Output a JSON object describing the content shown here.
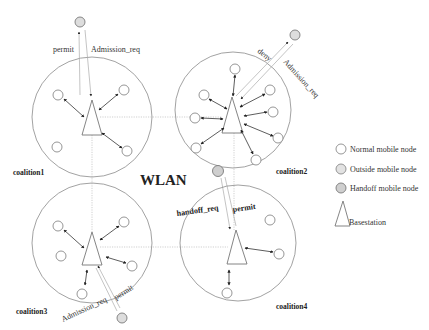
{
  "title": "WLAN",
  "colors": {
    "cell_stroke": "#8a8a8a",
    "normal_node_fill": "#ffffff",
    "outside_node_fill": "#dddddd",
    "handoff_node_fill": "#c4c4c4",
    "arrow": "#333333"
  },
  "coalitions": [
    {
      "id": "c1",
      "label": "coalition1"
    },
    {
      "id": "c2",
      "label": "coalition2"
    },
    {
      "id": "c3",
      "label": "coalition3"
    },
    {
      "id": "c4",
      "label": "coalition4"
    }
  ],
  "messages": {
    "c1_permit": "permit",
    "c1_admission": "Admission_req",
    "c2_deny": "deny",
    "c2_admission": "Admission_req",
    "c3_permit": "permit",
    "c3_admission": "Admission_req",
    "handoff_req": "handoff_req",
    "handoff_permit": "permit"
  },
  "legend": [
    {
      "icon": "normal-node-icon",
      "label": "Normal mobile node"
    },
    {
      "icon": "outside-node-icon",
      "label": "Outside mobile node"
    },
    {
      "icon": "handoff-node-icon",
      "label": "Handoff mobile node"
    },
    {
      "icon": "basestation-icon",
      "label": "Basestation"
    }
  ]
}
